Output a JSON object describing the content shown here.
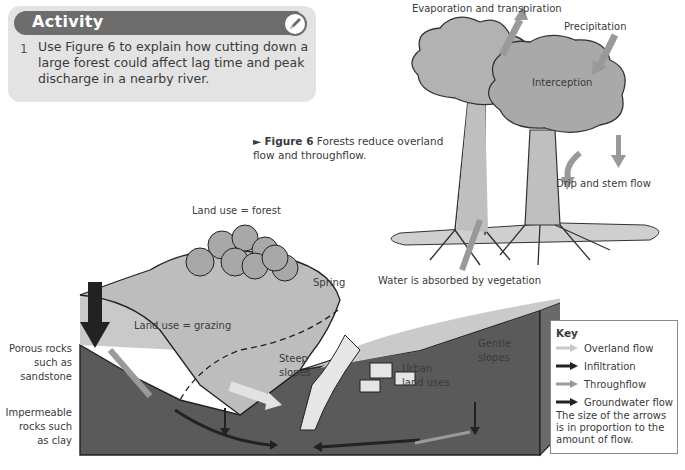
{
  "activity": {
    "title": "Activity",
    "icon": "pencil-icon",
    "question_number": "1",
    "question_text": "Use Figure 6 to explain how cutting down a large forest could affect lag time and peak discharge in a nearby river."
  },
  "figure": {
    "marker": "►",
    "label": "Figure 6",
    "caption": "Forests reduce overland flow and throughflow."
  },
  "tree_diagram": {
    "labels": {
      "evaporation": "Evaporation and transpiration",
      "precipitation": "Precipitation",
      "interception": "Interception",
      "drip": "Drip and stem flow",
      "absorbed": "Water is absorbed by vegetation"
    }
  },
  "landscape": {
    "labels": {
      "forest": "Land use = forest",
      "spring": "Spring",
      "grazing": "Land use = grazing",
      "porous": "Porous rocks such as sandstone",
      "porous_lines": [
        "Porous rocks",
        "such as",
        "sandstone"
      ],
      "impermeable_lines": [
        "Impermeable",
        "rocks such",
        "as clay"
      ],
      "steep_lines": [
        "Steep",
        "slopes"
      ],
      "urban_lines": [
        "Urban",
        "land uses"
      ],
      "gentle_lines": [
        "Gentle",
        "slopes"
      ]
    }
  },
  "key": {
    "title": "Key",
    "items": [
      {
        "label": "Overland flow",
        "color": "#c8c8c8"
      },
      {
        "label": "Infiltration",
        "color": "#222222"
      },
      {
        "label": "Throughflow",
        "color": "#9a9a9a"
      },
      {
        "label": "Groundwater flow",
        "color": "#222222"
      }
    ],
    "note": "The size of the arrows is in proportion to the amount of flow."
  },
  "colors": {
    "activity_bg": "#e3e3e3",
    "activity_header": "#6d6d6d",
    "foliage": "#b0b0b0",
    "ground": "#bdbdbd",
    "rock": "#555555"
  }
}
